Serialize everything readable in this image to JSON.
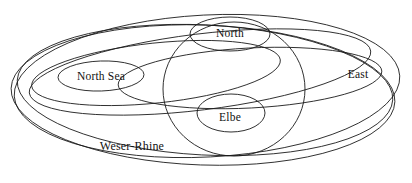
{
  "diagram": {
    "type": "euler-diagram",
    "title": "",
    "background_color": "#ffffff",
    "stroke_color": "#1a1a1a",
    "text_color": "#111111",
    "regions": [
      {
        "id": "north-sea",
        "label": "North Sea",
        "label_x": 101,
        "label_y": 76,
        "shape": "ellipse",
        "cx": 101,
        "cy": 76,
        "rx": 43,
        "ry": 15,
        "rotate": -2
      },
      {
        "id": "north",
        "label": "North",
        "label_x": 230,
        "label_y": 33,
        "shape": "ellipse",
        "cx": 230,
        "cy": 34,
        "rx": 40,
        "ry": 17,
        "rotate": 0
      },
      {
        "id": "east",
        "label": "East",
        "label_x": 358,
        "label_y": 74,
        "shape": "ellipse",
        "cx": 250,
        "cy": 78,
        "rx": 132,
        "ry": 30,
        "rotate": -3
      },
      {
        "id": "elbe",
        "label": "Elbe",
        "label_x": 230,
        "label_y": 117,
        "shape": "ellipse",
        "cx": 231,
        "cy": 113,
        "rx": 34,
        "ry": 19,
        "rotate": 0
      },
      {
        "id": "weser-rhine",
        "label": "Weser-Rhine",
        "label_x": 132,
        "label_y": 146,
        "shape": "ellipse",
        "cx": 203,
        "cy": 95,
        "rx": 192,
        "ry": 70,
        "rotate": 2
      }
    ],
    "unlabeled_curves": [
      {
        "id": "outer-ring-a",
        "cx": 207,
        "cy": 86,
        "rx": 193,
        "ry": 71,
        "rotate": -3
      },
      {
        "id": "outer-ring-b",
        "cx": 205,
        "cy": 94,
        "rx": 190,
        "ry": 68,
        "rotate": 2
      },
      {
        "id": "tilted-band",
        "cx": 200,
        "cy": 72,
        "rx": 172,
        "ry": 38,
        "rotate": -7
      },
      {
        "id": "inner-band-left",
        "cx": 156,
        "cy": 73,
        "rx": 125,
        "ry": 30,
        "rotate": -6
      },
      {
        "id": "big-circle",
        "cx": 234,
        "cy": 89,
        "rx": 71,
        "ry": 67,
        "rotate": 0
      }
    ]
  }
}
